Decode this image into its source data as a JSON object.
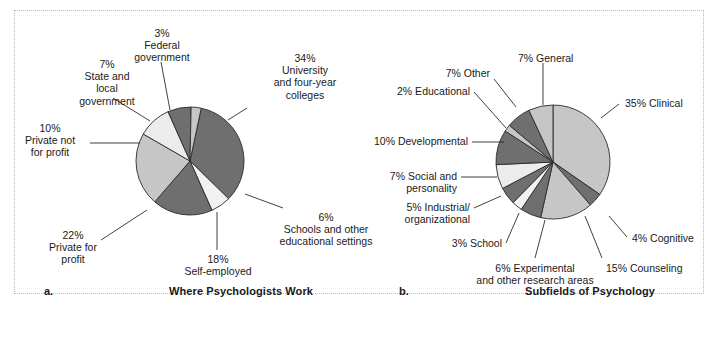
{
  "figure": {
    "panel_a_letter": "a.",
    "panel_b_letter": "b.",
    "panel_a_caption": "Where Psychologists Work",
    "panel_b_caption": "Subfields of Psychology"
  },
  "chart_data": [
    {
      "type": "pie",
      "title": "Where Psychologists Work",
      "panel": "a",
      "unit": "percent",
      "legend": "labels placed around pie with leader lines",
      "categories": [
        "University and four-year colleges",
        "Schools and other educational settings",
        "Self-employed",
        "Private for profit",
        "Private not for profit",
        "State and local government",
        "Federal government"
      ],
      "values": [
        34,
        6,
        18,
        22,
        10,
        7,
        3
      ],
      "labels": [
        {
          "pct": "34%",
          "name": "University\nand four-year\ncolleges",
          "fill": "#6f6f6f"
        },
        {
          "pct": "6%",
          "name": "Schools and other\neducational settings",
          "fill": "#f2f2f2"
        },
        {
          "pct": "18%",
          "name": "Self-employed",
          "fill": "#6f6f6f"
        },
        {
          "pct": "22%",
          "name": "Private for\nprofit",
          "fill": "#c6c6c6"
        },
        {
          "pct": "10%",
          "name": "Private not\nfor profit",
          "fill": "#ececec"
        },
        {
          "pct": "7%",
          "name": "State and\nlocal\ngovernment",
          "fill": "#6f6f6f"
        },
        {
          "pct": "3%",
          "name": "Federal\ngovernment",
          "fill": "#c6c6c6"
        }
      ]
    },
    {
      "type": "pie",
      "title": "Subfields of Psychology",
      "panel": "b",
      "unit": "percent",
      "legend": "labels placed around pie with leader lines",
      "categories": [
        "Clinical",
        "Cognitive",
        "Counseling",
        "Experimental and other research areas",
        "School",
        "Industrial/organizational",
        "Social and personality",
        "Developmental",
        "Educational",
        "Other",
        "General"
      ],
      "values": [
        35,
        4,
        15,
        6,
        3,
        5,
        7,
        10,
        2,
        7,
        7
      ],
      "labels": [
        {
          "pct": "35%",
          "name": "Clinical",
          "fill": "#c6c6c6"
        },
        {
          "pct": "4%",
          "name": "Cognitive",
          "fill": "#6f6f6f"
        },
        {
          "pct": "15%",
          "name": "Counseling",
          "fill": "#c6c6c6"
        },
        {
          "pct": "6%",
          "name": "Experimental\nand other research areas",
          "fill": "#6f6f6f"
        },
        {
          "pct": "3%",
          "name": "School",
          "fill": "#f2f2f2"
        },
        {
          "pct": "5%",
          "name": "Industrial/\norganizational",
          "fill": "#6f6f6f"
        },
        {
          "pct": "7%",
          "name": "Social and\npersonality",
          "fill": "#ececec"
        },
        {
          "pct": "10%",
          "name": "Developmental",
          "fill": "#6f6f6f"
        },
        {
          "pct": "2%",
          "name": "Educational",
          "fill": "#c6c6c6"
        },
        {
          "pct": "7%",
          "name": "Other",
          "fill": "#6f6f6f"
        },
        {
          "pct": "7%",
          "name": "General",
          "fill": "#c6c6c6"
        }
      ]
    }
  ],
  "labels_a": {
    "state_local": "7%\nState and\nlocal\ngovernment",
    "federal": "3%\nFederal\ngovernment",
    "university": "34%\nUniversity\nand four-year\ncolleges",
    "private_not_for_profit": "10%\nPrivate not\nfor profit",
    "private_for_profit": "22%\nPrivate for\nprofit",
    "self_employed": "18%\nSelf-employed",
    "schools": "6%\nSchools and other\neducational settings"
  },
  "labels_b": {
    "general": "7% General",
    "clinical": "35% Clinical",
    "other": "7% Other",
    "educational": "2% Educational",
    "developmental": "10% Developmental",
    "social_personality": "7% Social and\npersonality",
    "industrial": "5% Industrial/\norganizational",
    "school": "3% School",
    "experimental": "6% Experimental\nand other research areas",
    "counseling": "15% Counseling",
    "cognitive": "4% Cognitive"
  },
  "colors": {
    "dark_gray": "#6f6f6f",
    "mid_gray": "#c6c6c6",
    "light_gray": "#ececec",
    "near_white": "#f4f4f4",
    "outline": "#2b2b2b",
    "panel_border": "#bdbdbd",
    "text": "#1a1a1a"
  }
}
